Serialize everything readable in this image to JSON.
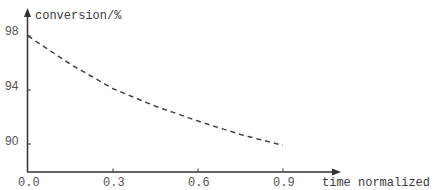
{
  "chart_data": {
    "type": "line",
    "title": "",
    "xlabel": "time normalized",
    "ylabel": "conversion/%",
    "x_ticks": [
      "0.0",
      "0.3",
      "0.6",
      "0.9"
    ],
    "y_ticks": [
      "98",
      "94",
      "90"
    ],
    "xlim": [
      0.0,
      1.0
    ],
    "ylim": [
      88,
      100
    ],
    "grid": false,
    "legend": null,
    "series": [
      {
        "name": "conversion",
        "style": "dashed",
        "color": "#444444",
        "x": [
          0.0,
          0.15,
          0.3,
          0.45,
          0.6,
          0.75,
          0.9
        ],
        "y": [
          98.0,
          95.9,
          94.1,
          92.8,
          91.7,
          90.7,
          89.9
        ]
      }
    ]
  }
}
